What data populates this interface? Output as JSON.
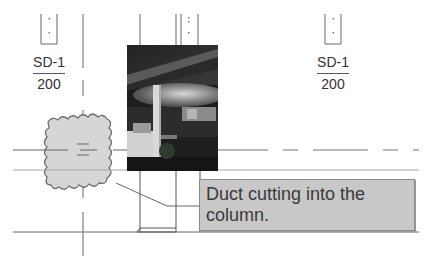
{
  "diagram": {
    "type": "mep-clash-markup",
    "duct_tags": [
      {
        "label": "SD-1",
        "size": "200",
        "position": "left"
      },
      {
        "label": "SD-1",
        "size": "200",
        "position": "right"
      }
    ],
    "callout": {
      "text": "Duct cutting into the column."
    },
    "photo": {
      "description": "office interior with column"
    },
    "revision_cloud": {
      "description": "revision cloud marking clash location"
    },
    "colors": {
      "line": "#555555",
      "cloud_fill": "#d6d6d6",
      "cloud_stroke": "#6e6e6e",
      "callout_fill": "#c8c8c8",
      "text": "#333333"
    }
  }
}
